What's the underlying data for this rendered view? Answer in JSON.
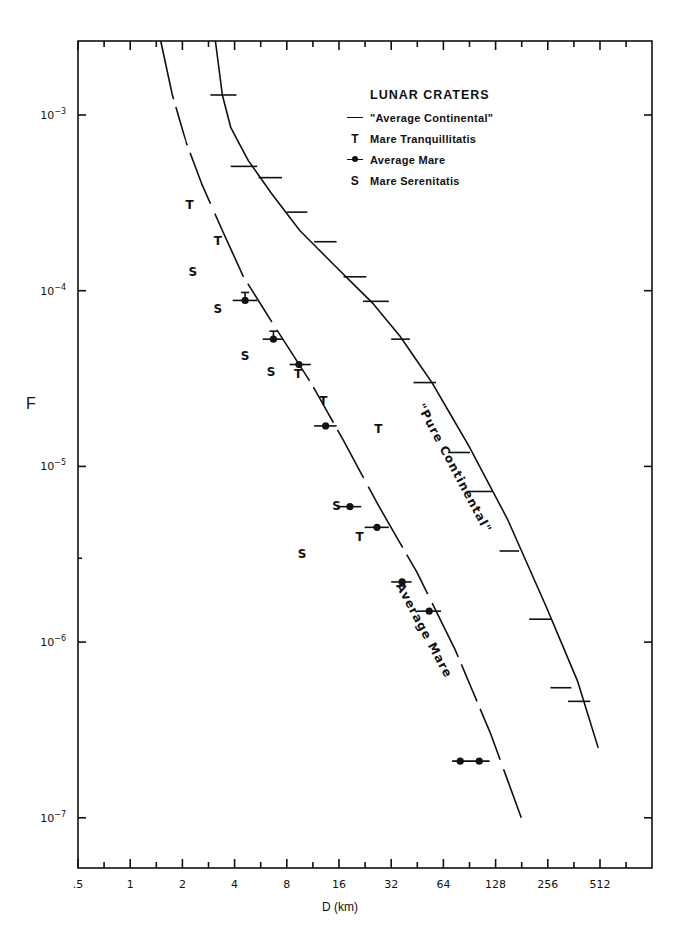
{
  "chart_data": {
    "type": "line",
    "title": "LUNAR CRATERS",
    "xlabel": "D (km)",
    "ylabel": "F",
    "xscale": "log2",
    "yscale": "log10",
    "xlim": [
      0.5,
      1024
    ],
    "ylim": [
      5e-08,
      0.003
    ],
    "grid": false,
    "legend_position": "upper right (inside)",
    "x_ticks": [
      ".5",
      "1",
      "2",
      "4",
      "8",
      "16",
      "32",
      "64",
      "128",
      "256",
      "512"
    ],
    "x_tick_values": [
      0.5,
      1,
      2,
      4,
      8,
      16,
      32,
      64,
      128,
      256,
      512
    ],
    "y_ticks": [
      "10^-3",
      "10^-4",
      "10^-5",
      "10^-6",
      "10^-7"
    ],
    "y_tick_values": [
      0.001,
      0.0001,
      1e-05,
      1e-06,
      1e-07
    ],
    "legend": [
      {
        "symbol": "line",
        "label": "\"Average Continental\""
      },
      {
        "symbol": "T",
        "label": "Mare Tranquillitatis"
      },
      {
        "symbol": "dot",
        "label": "Average Mare"
      },
      {
        "symbol": "S",
        "label": "Mare Serenitatis"
      }
    ],
    "annotations": [
      {
        "text": "\"Pure Continental\"",
        "D": 45,
        "F": 2.2e-05,
        "rotation": 62
      },
      {
        "text": "Average Mare",
        "D": 34,
        "F": 2.1e-06,
        "rotation": 62
      }
    ],
    "series": [
      {
        "name": "\"Average Continental\" (curve)",
        "kind": "curve",
        "points": [
          [
            3.1,
            0.003
          ],
          [
            3.4,
            0.0013
          ],
          [
            3.8,
            0.00085
          ],
          [
            4.8,
            0.00055
          ],
          [
            6.5,
            0.00036
          ],
          [
            9.5,
            0.00022
          ],
          [
            15,
            0.00014
          ],
          [
            25,
            8.5e-05
          ],
          [
            36,
            5.5e-05
          ],
          [
            55,
            3e-05
          ],
          [
            90,
            1.3e-05
          ],
          [
            150,
            5e-06
          ],
          [
            250,
            1.6e-06
          ],
          [
            380,
            6e-07
          ],
          [
            500,
            2.5e-07
          ]
        ]
      },
      {
        "name": "\"Average Continental\" (data with x-error bars)",
        "kind": "hbars",
        "points": [
          {
            "D": 3.4,
            "F": 0.0013,
            "dlo": 2.9,
            "dhi": 4.1
          },
          {
            "D": 5.0,
            "F": 0.00051,
            "dlo": 3.8,
            "dhi": 5.4
          },
          {
            "D": 6.2,
            "F": 0.00044,
            "dlo": 5.5,
            "dhi": 7.5
          },
          {
            "D": 9.1,
            "F": 0.00028,
            "dlo": 8.0,
            "dhi": 10.5
          },
          {
            "D": 13.5,
            "F": 0.00019,
            "dlo": 11.5,
            "dhi": 15.5
          },
          {
            "D": 20,
            "F": 0.00012,
            "dlo": 17,
            "dhi": 23
          },
          {
            "D": 26,
            "F": 8.7e-05,
            "dlo": 22,
            "dhi": 31
          },
          {
            "D": 36,
            "F": 5.3e-05,
            "dlo": 32,
            "dhi": 41
          },
          {
            "D": 50,
            "F": 3e-05,
            "dlo": 43,
            "dhi": 58
          },
          {
            "D": 76,
            "F": 1.2e-05,
            "dlo": 68,
            "dhi": 91
          },
          {
            "D": 100,
            "F": 7.2e-06,
            "dlo": 88,
            "dhi": 122
          },
          {
            "D": 150,
            "F": 3.3e-06,
            "dlo": 135,
            "dhi": 175
          },
          {
            "D": 230,
            "F": 1.35e-06,
            "dlo": 200,
            "dhi": 270
          },
          {
            "D": 300,
            "F": 5.5e-07,
            "dlo": 265,
            "dhi": 350
          },
          {
            "D": 370,
            "F": 4.6e-07,
            "dlo": 335,
            "dhi": 450
          }
        ]
      },
      {
        "name": "Average Mare (curve)",
        "kind": "curve-dashed-gaps",
        "points": [
          [
            1.5,
            0.003
          ],
          [
            1.75,
            0.0013
          ],
          [
            2.1,
            0.0007
          ],
          [
            2.6,
            0.0004
          ],
          [
            3.4,
            0.00022
          ],
          [
            4.5,
            0.00012
          ],
          [
            7,
            6e-05
          ],
          [
            11,
            3e-05
          ],
          [
            17,
            1.4e-05
          ],
          [
            27,
            6e-06
          ],
          [
            45,
            2.5e-06
          ],
          [
            75,
            9e-07
          ],
          [
            120,
            3e-07
          ],
          [
            180,
            1e-07
          ]
        ]
      },
      {
        "name": "Average Mare",
        "kind": "dots-hbars",
        "points": [
          {
            "D": 4.6,
            "F": 8.8e-05,
            "dlo": 3.9,
            "dhi": 5.4,
            "vbar": true
          },
          {
            "D": 6.7,
            "F": 5.3e-05,
            "dlo": 5.8,
            "dhi": 7.6,
            "vbar": true
          },
          {
            "D": 9.4,
            "F": 3.8e-05,
            "dlo": 8.3,
            "dhi": 11.0
          },
          {
            "D": 13.4,
            "F": 1.7e-05,
            "dlo": 11.5,
            "dhi": 15.5
          },
          {
            "D": 18.5,
            "F": 5.9e-06,
            "dlo": 15.5,
            "dhi": 21.5
          },
          {
            "D": 26.5,
            "F": 4.5e-06,
            "dlo": 22.5,
            "dhi": 31
          },
          {
            "D": 37,
            "F": 2.2e-06,
            "dlo": 32,
            "dhi": 42
          },
          {
            "D": 53,
            "F": 1.5e-06,
            "dlo": 45,
            "dhi": 62
          },
          {
            "D": 80,
            "F": 2.1e-07,
            "dlo": 72,
            "dhi": 118
          },
          {
            "D": 103,
            "F": 2.1e-07,
            "dlo": 72,
            "dhi": 118
          }
        ]
      },
      {
        "name": "Mare Tranquillitatis",
        "kind": "letter",
        "marker": "T",
        "points": [
          [
            2.2,
            0.00031
          ],
          [
            3.2,
            0.000195
          ],
          [
            9.3,
            3.4e-05
          ],
          [
            13,
            2.4e-05
          ],
          [
            27,
            1.65e-05
          ],
          [
            21,
            4e-06
          ]
        ]
      },
      {
        "name": "Mare Serenitatis",
        "kind": "letter",
        "marker": "S",
        "points": [
          [
            2.3,
            0.00013
          ],
          [
            3.2,
            8e-05
          ],
          [
            4.6,
            4.3e-05
          ],
          [
            6.5,
            3.5e-05
          ],
          [
            15.5,
            6e-06
          ],
          [
            9.8,
            3.2e-06
          ]
        ]
      }
    ]
  },
  "legend_title": "LUNAR CRATERS",
  "legend_items": [
    {
      "symbol": "",
      "label": "\"Average Continental\""
    },
    {
      "symbol": "T",
      "label": "Mare Tranquillitatis"
    },
    {
      "symbol": "",
      "label": "Average Mare"
    },
    {
      "symbol": "S",
      "label": "Mare Serenitatis"
    }
  ],
  "axis": {
    "xlabel": "D (km)",
    "ylabel": "F"
  }
}
